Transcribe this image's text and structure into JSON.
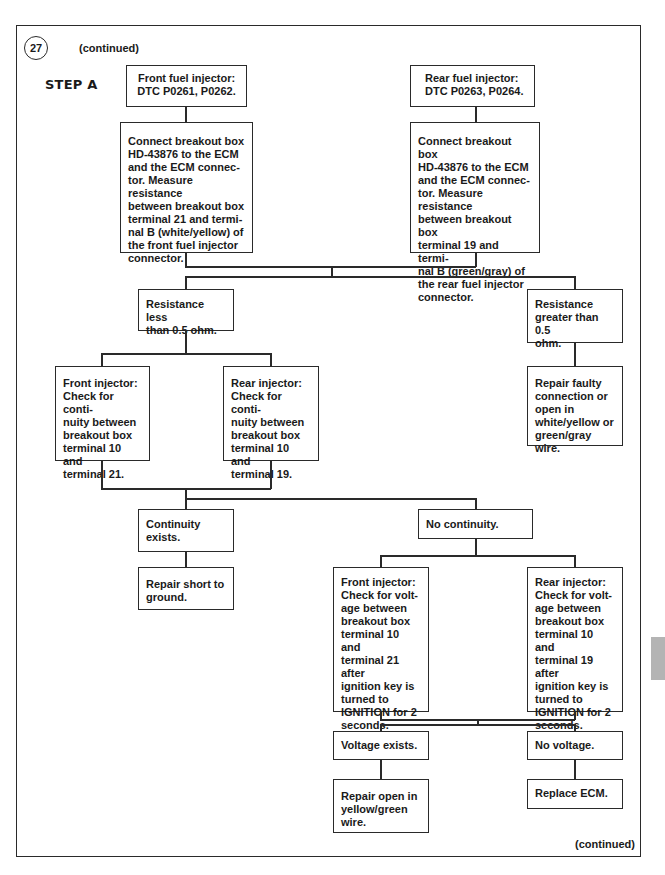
{
  "header": {
    "step_number": "27",
    "continued_top": "(continued)",
    "step_label": "STEP A"
  },
  "footer": {
    "continued_bottom": "(continued)"
  },
  "nodes": {
    "front_dtc": "Front fuel injector:\nDTC P0261, P0262.",
    "rear_dtc": "Rear fuel injector:\nDTC P0263, P0264.",
    "front_connect": "Connect breakout box\nHD-43876 to the ECM\nand the ECM connec-\ntor. Measure resistance\nbetween breakout box\nterminal 21 and termi-\nnal B (white/yellow) of\nthe front fuel injector\nconnector.",
    "rear_connect": "Connect breakout box\nHD-43876 to the ECM\nand the ECM connec-\ntor. Measure resistance\nbetween breakout box\nterminal 19 and termi-\nnal B (green/gray) of\nthe rear fuel injector\nconnector.",
    "resistance_less": "Resistance less\nthan 0.5 ohm.",
    "resistance_greater": "Resistance\ngreater than 0.5\nohm.",
    "repair_faulty": "Repair faulty\nconnection or\nopen in\nwhite/yellow or\ngreen/gray wire.",
    "front_continuity": "Front injector:\nCheck for conti-\nnuity between\nbreakout box\nterminal 10 and\nterminal 21.",
    "rear_continuity": "Rear injector:\nCheck for conti-\nnuity between\nbreakout box\nterminal 10 and\nterminal 19.",
    "continuity_exists": "Continuity\n exists.",
    "repair_short": "Repair short to\nground.",
    "no_continuity": "No continuity.",
    "front_voltage": "Front injector:\nCheck for volt-\nage between\nbreakout box\nterminal 10 and\nterminal 21 after\nignition key is\nturned to\nIGNITION  for 2\nseconds.",
    "rear_voltage": "Rear injector:\nCheck for volt-\nage between\nbreakout box\nterminal 10 and\nterminal 19 after\nignition key is\nturned to\nIGNITION for 2\nseconds.",
    "voltage_exists": "Voltage exists.",
    "no_voltage": "No voltage.",
    "repair_open": "Repair open in\nyellow/green\nwire.",
    "replace_ecm": "Replace ECM."
  },
  "colors": {
    "line": "#2a2a2a",
    "background": "#ffffff",
    "side_tab": "#b4b4b4"
  }
}
